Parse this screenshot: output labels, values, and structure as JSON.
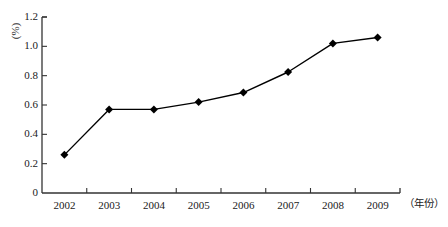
{
  "chart_data": {
    "type": "line",
    "title": "",
    "xlabel": "（年份）",
    "ylabel": "(%)",
    "categories": [
      "2002",
      "2003",
      "2004",
      "2005",
      "2006",
      "2007",
      "2008",
      "2009"
    ],
    "values": [
      0.26,
      0.57,
      0.57,
      0.62,
      0.685,
      0.825,
      1.02,
      1.06
    ],
    "series": [
      {
        "name": "",
        "values": [
          0.26,
          0.57,
          0.57,
          0.62,
          0.685,
          0.825,
          1.02,
          1.06
        ]
      }
    ],
    "ylim": [
      0,
      1.2
    ],
    "ytick_labels": [
      "0",
      "0.2",
      "0.4",
      "0.6",
      "0.8",
      "1.0",
      "1.2"
    ],
    "ytick_values": [
      0,
      0.2,
      0.4,
      0.6,
      0.8,
      1.0,
      1.2
    ],
    "grid": false,
    "legend": false,
    "legend_position": "none",
    "marker": "diamond",
    "line_color": "#000000",
    "marker_color": "#000000",
    "axis_color": "#333333",
    "background_color": "#ffffff"
  }
}
